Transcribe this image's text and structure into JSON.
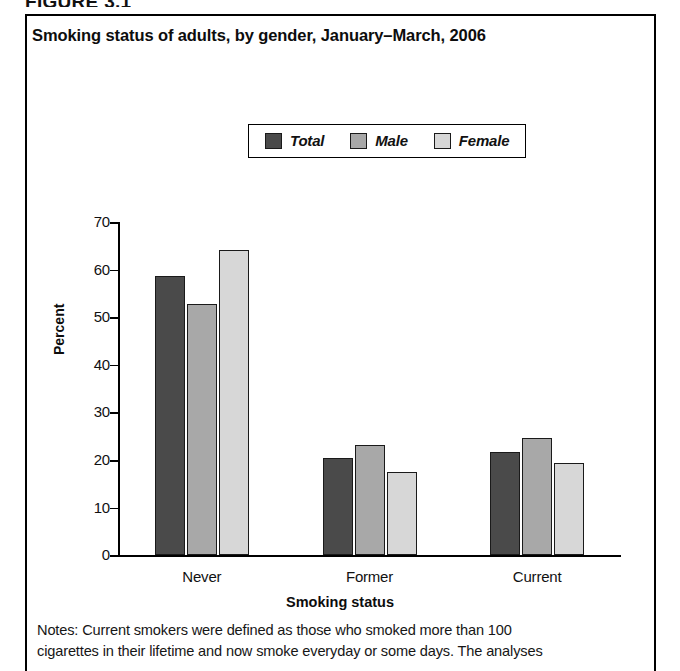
{
  "figure_header": "FIGURE 3.1",
  "chart_title": "Smoking status of adults, by gender, January–March, 2006",
  "legend": {
    "items": [
      {
        "label": "Total",
        "color": "#4a4a4a"
      },
      {
        "label": "Male",
        "color": "#a8a8a8"
      },
      {
        "label": "Female",
        "color": "#d7d7d7"
      }
    ]
  },
  "axes": {
    "ylabel": "Percent",
    "xlabel": "Smoking status",
    "yticks": [
      "70",
      "60",
      "50",
      "40",
      "30",
      "20",
      "10",
      "0"
    ]
  },
  "notes": {
    "line1": "Notes: Current smokers were defined as those who smoked more than 100",
    "line2": "cigarettes in their lifetime and now smoke everyday or some days. The analyses"
  },
  "chart_data": {
    "type": "bar",
    "title": "Smoking status of adults, by gender, January–March, 2006",
    "xlabel": "Smoking status",
    "ylabel": "Percent",
    "ylim": [
      0,
      70
    ],
    "ytick_step": 10,
    "grid": false,
    "legend_position": "top-center",
    "categories": [
      "Never",
      "Former",
      "Current"
    ],
    "series": [
      {
        "name": "Total",
        "color": "#4a4a4a",
        "values": [
          58.7,
          20.5,
          21.7
        ]
      },
      {
        "name": "Male",
        "color": "#a8a8a8",
        "values": [
          52.8,
          23.2,
          24.6
        ]
      },
      {
        "name": "Female",
        "color": "#d7d7d7",
        "values": [
          64.1,
          17.5,
          19.4
        ]
      }
    ]
  }
}
